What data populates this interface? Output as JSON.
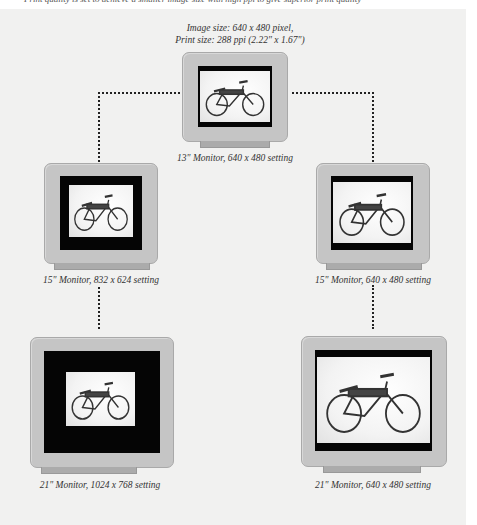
{
  "top_cutoff_text": "Print quality is set to achieve a smaller image size with high ppi to give superior print quality",
  "header_caption": {
    "line1": "Image size: 640 x 480 pixel,",
    "line2": "Print size: 288 ppi (2.22\" x 1.67\")"
  },
  "monitors": [
    {
      "id": "top",
      "label": "13\" Monitor, 640 x 480 setting",
      "icon": "bicycle-image"
    },
    {
      "id": "mid-left",
      "label": "15\" Monitor, 832 x 624 setting",
      "icon": "bicycle-image"
    },
    {
      "id": "mid-right",
      "label": "15\" Monitor, 640 x 480 setting",
      "icon": "bicycle-image"
    },
    {
      "id": "bottom-left",
      "label": "21\" Monitor, 1024 x 768 setting",
      "icon": "bicycle-image"
    },
    {
      "id": "bottom-right",
      "label": "21\" Monitor, 640 x 480 setting",
      "icon": "bicycle-image"
    }
  ],
  "colors": {
    "panel_bg": "#f1f1f0",
    "bezel": "#c5c5c5",
    "screen": "#050505",
    "stand": "#ababab",
    "connector": "#222222"
  }
}
